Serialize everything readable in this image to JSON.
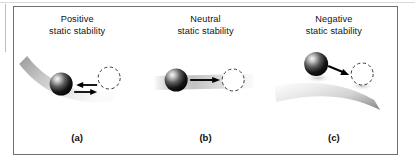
{
  "figure": {
    "kind": "static-stability-ball-and-surface-diagram",
    "background_color": "#ffffff",
    "frame_color": "#6e6e6e",
    "panels": [
      {
        "id": "a",
        "title": "Positive\nstatic stability",
        "title_line1": "Positive",
        "title_line2": "static stability",
        "caption": "(a)",
        "surface": "concave",
        "surface_description": "ball in a bowl returns to equilibrium",
        "ball_fill_light": "#f2f2f2",
        "ball_fill_dark": "#000000",
        "displaced_circle_style": "dashed outline",
        "arrows": [
          {
            "name": "restoring-arrow-left",
            "direction": "left"
          },
          {
            "name": "displacement-arrow-right",
            "direction": "right"
          }
        ]
      },
      {
        "id": "b",
        "title": "Neutral\nstatic stability",
        "title_line1": "Neutral",
        "title_line2": "static  stability",
        "caption": "(b)",
        "surface": "flat",
        "surface_description": "ball on a flat plane stays where displaced",
        "ball_fill_light": "#f2f2f2",
        "ball_fill_dark": "#000000",
        "displaced_circle_style": "dashed outline",
        "arrows": [
          {
            "name": "displacement-arrow-right",
            "direction": "right"
          }
        ]
      },
      {
        "id": "c",
        "title": "Negative\nstatic stability",
        "title_line1": "Negative",
        "title_line2": "static stability",
        "caption": "(c)",
        "surface": "convex",
        "surface_description": "ball on a dome rolls further away",
        "ball_fill_light": "#f2f2f2",
        "ball_fill_dark": "#000000",
        "displaced_circle_style": "dashed outline",
        "arrows": [
          {
            "name": "divergence-arrow-down-right",
            "direction": "down-right"
          }
        ]
      }
    ]
  }
}
